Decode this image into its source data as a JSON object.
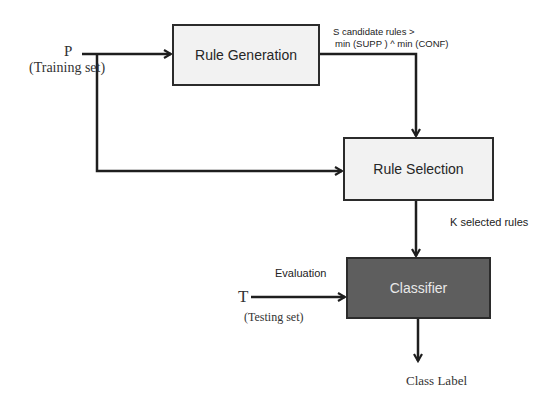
{
  "diagram": {
    "type": "flowchart",
    "nodes": {
      "rule_generation": {
        "label": "Rule Generation"
      },
      "rule_selection": {
        "label": "Rule Selection"
      },
      "classifier": {
        "label": "Classifier"
      }
    },
    "inputs": {
      "training": {
        "symbol": "P",
        "caption": "(Training set)"
      },
      "testing": {
        "symbol": "T",
        "caption": "(Testing set)"
      }
    },
    "edge_labels": {
      "candidate_rules_line1": "S candidate rules >",
      "candidate_rules_line2": "min (SUPP ) ^ min (CONF)",
      "selected_rules": "K selected rules",
      "evaluation": "Evaluation"
    },
    "output": {
      "label": "Class Label"
    },
    "colors": {
      "line": "#1e1e1e",
      "light_box_fill": "#f2f2f2",
      "dark_box_fill": "#5e5e5e",
      "dark_box_text": "#e9e9e9"
    },
    "edges": [
      {
        "from": "P",
        "to": "Rule Generation"
      },
      {
        "from": "P",
        "to": "Rule Selection"
      },
      {
        "from": "Rule Generation",
        "to": "Rule Selection",
        "label": "S candidate rules > min (SUPP ) ^ min (CONF)"
      },
      {
        "from": "Rule Selection",
        "to": "Classifier",
        "label": "K selected rules"
      },
      {
        "from": "T",
        "to": "Classifier",
        "label": "Evaluation"
      },
      {
        "from": "Classifier",
        "to": "Class Label"
      }
    ]
  }
}
